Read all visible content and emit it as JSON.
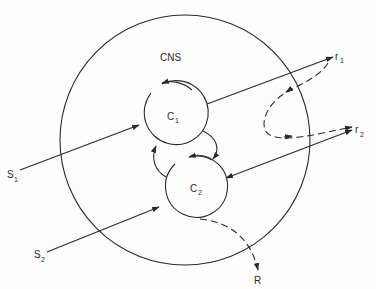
{
  "diagram": {
    "type": "neural-control-schematic",
    "outer_circle": {
      "label": "CNS"
    },
    "centers": [
      {
        "id": "C1",
        "label": "C",
        "subscript": "1"
      },
      {
        "id": "C2",
        "label": "C",
        "subscript": "2"
      }
    ],
    "inputs": [
      {
        "id": "S1",
        "label": "S",
        "subscript": "1",
        "target": "C1"
      },
      {
        "id": "S2",
        "label": "S",
        "subscript": "2",
        "target": "C2"
      }
    ],
    "receptors": [
      {
        "id": "r1",
        "label": "r",
        "subscript": "1",
        "source": "C1"
      },
      {
        "id": "r2",
        "label": "r",
        "subscript": "2",
        "link": "C2",
        "bidirectional": true
      }
    ],
    "response": {
      "id": "R",
      "label": "R",
      "source": "C2",
      "style": "dashed"
    },
    "internal_links": [
      {
        "from": "C1",
        "to": "C2",
        "style": "solid-curved"
      },
      {
        "from": "C2",
        "to": "C1",
        "style": "solid-curved"
      },
      {
        "from": "C1",
        "to": "C1",
        "style": "self-loop"
      },
      {
        "from": "C2",
        "to": "C2",
        "style": "self-loop"
      }
    ],
    "feedback_link": {
      "from": "r1",
      "to": "r2",
      "style": "dashed-loop"
    },
    "colors": {
      "ink": "#2a2a2a",
      "background": "#fdfdfd"
    }
  }
}
